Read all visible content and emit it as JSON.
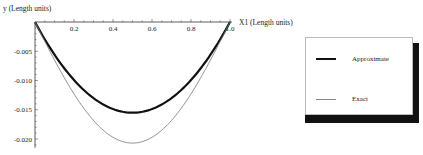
{
  "chart_data": {
    "type": "line",
    "title": "",
    "xlabel": "X1 (Length units)",
    "ylabel": "y (Length units)",
    "xlim": [
      0,
      1.0
    ],
    "ylim": [
      -0.0215,
      0
    ],
    "x_ticks": [
      "0.2",
      "0.4",
      "0.6",
      "0.8",
      "1.0"
    ],
    "y_ticks": [
      "-0.005",
      "-0.010",
      "-0.015",
      "-0.020"
    ],
    "grid": false,
    "legend_position": "right",
    "x": [
      0,
      0.1,
      0.2,
      0.3,
      0.4,
      0.5,
      0.6,
      0.7,
      0.8,
      0.9,
      1.0
    ],
    "series": [
      {
        "name": "Approximate",
        "style": "thick",
        "values": [
          0,
          -0.0056,
          -0.0099,
          -0.013,
          -0.0149,
          -0.0155,
          -0.0149,
          -0.013,
          -0.0099,
          -0.0056,
          0
        ]
      },
      {
        "name": "Exact",
        "style": "thin",
        "values": [
          0,
          -0.0066,
          -0.0121,
          -0.0163,
          -0.0194,
          -0.0207,
          -0.0194,
          -0.0163,
          -0.0121,
          -0.0066,
          0
        ]
      }
    ]
  },
  "axes": {
    "x_label": "X1 (Length units)",
    "y_label": "y (Length units)",
    "x_tick_labels": [
      "0.2",
      "0.4",
      "0.6",
      "0.8",
      "1.0"
    ],
    "y_tick_labels": [
      "-0.005",
      "-0.010",
      "-0.015",
      "-0.020"
    ]
  },
  "legend": {
    "items": [
      {
        "label": "Approximate",
        "color": "#111111",
        "width": 2.2
      },
      {
        "label": "Exact",
        "color": "#777777",
        "width": 0.8
      }
    ]
  }
}
